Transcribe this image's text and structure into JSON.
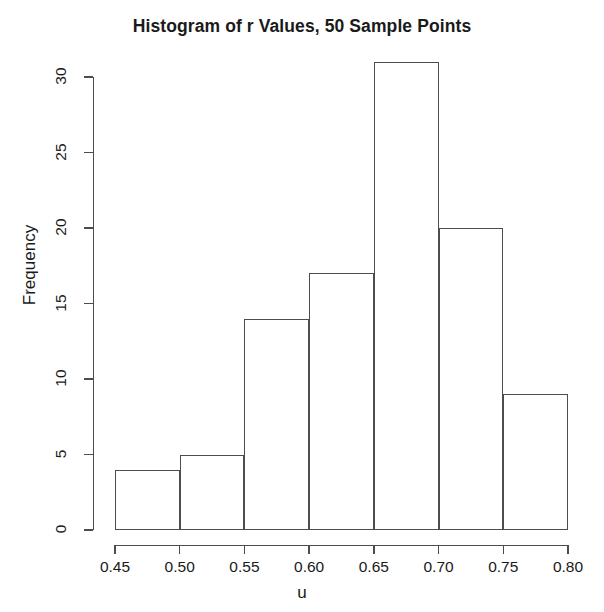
{
  "chart_data": {
    "type": "bar",
    "title": "Histogram of r Values, 50 Sample Points",
    "xlabel": "u",
    "ylabel": "Frequency",
    "bin_edges": [
      0.45,
      0.5,
      0.55,
      0.6,
      0.65,
      0.7,
      0.75,
      0.8
    ],
    "categories": [
      "0.45-0.50",
      "0.50-0.55",
      "0.55-0.60",
      "0.60-0.65",
      "0.65-0.70",
      "0.70-0.75",
      "0.75-0.80"
    ],
    "values": [
      4,
      5,
      14,
      17,
      31,
      20,
      9
    ],
    "xlim": [
      0.45,
      0.8
    ],
    "ylim": [
      0,
      31
    ],
    "xticks": [
      0.45,
      0.5,
      0.55,
      0.6,
      0.65,
      0.7,
      0.75,
      0.8
    ],
    "xtick_labels": [
      "0.45",
      "0.50",
      "0.55",
      "0.60",
      "0.65",
      "0.70",
      "0.75",
      "0.80"
    ],
    "yticks": [
      0,
      5,
      10,
      15,
      20,
      25,
      30
    ],
    "ytick_labels": [
      "0",
      "5",
      "10",
      "15",
      "20",
      "25",
      "30"
    ],
    "grid": false,
    "legend": false,
    "bar_fill": "transparent",
    "bar_stroke": "#4d4d4d",
    "background": "#ffffff",
    "text_color": "#1a1a1a"
  }
}
